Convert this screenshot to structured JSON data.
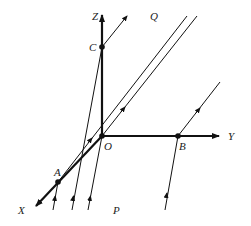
{
  "figure": {
    "type": "3d-coordinate-projection-diagram",
    "colors": {
      "ink": "#111111",
      "background": "#ffffff"
    }
  },
  "labels": {
    "Z": "Z",
    "Q": "Q",
    "C": "C",
    "O": "O",
    "Y": "Y",
    "B": "B",
    "A": "A",
    "X": "X",
    "P": "P"
  },
  "points": {
    "O": {
      "x": 102,
      "y": 136,
      "label": "O"
    },
    "A": {
      "x": 58,
      "y": 182,
      "label": "A"
    },
    "B": {
      "x": 178,
      "y": 136,
      "label": "B"
    },
    "C": {
      "x": 102,
      "y": 47,
      "label": "C"
    }
  },
  "axes": [
    {
      "name": "Z",
      "from": [
        102,
        136
      ],
      "to": [
        102,
        14
      ]
    },
    {
      "name": "Y",
      "from": [
        102,
        136
      ],
      "to": [
        220,
        136
      ]
    },
    {
      "name": "X",
      "from": [
        102,
        136
      ],
      "to": [
        35,
        207
      ]
    }
  ],
  "rays": [
    {
      "name": "incoming-to-A",
      "from": [
        53,
        210
      ],
      "to": [
        58,
        182
      ]
    },
    {
      "name": "incoming-to-C",
      "from": [
        72,
        210
      ],
      "to": [
        102,
        47
      ]
    },
    {
      "name": "incoming-to-O",
      "from": [
        88,
        210
      ],
      "to": [
        102,
        136
      ]
    },
    {
      "name": "incoming-to-B",
      "from": [
        165,
        210
      ],
      "to": [
        178,
        136
      ]
    },
    {
      "name": "outgoing-from-C",
      "from": [
        102,
        47
      ],
      "to": [
        127,
        16
      ]
    },
    {
      "name": "outgoing-from-B",
      "from": [
        178,
        136
      ],
      "to": [
        220,
        82
      ]
    },
    {
      "name": "parallel-line-through-A",
      "from": [
        58,
        182
      ],
      "to": [
        187,
        16
      ]
    },
    {
      "name": "parallel-line-through-O",
      "from": [
        102,
        136
      ],
      "to": [
        197,
        16
      ]
    }
  ]
}
